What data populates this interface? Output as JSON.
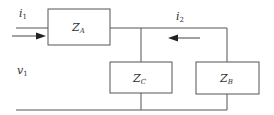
{
  "diagram": {
    "type": "two-port circuit",
    "labels": {
      "i1": "i",
      "i1_sub": "1",
      "i2": "i",
      "i2_sub": "2",
      "v1": "v",
      "v1_sub": "1",
      "za": "Z",
      "za_sub": "A",
      "zb": "Z",
      "zb_sub": "B",
      "zc": "Z",
      "zc_sub": "C"
    },
    "colors": {
      "line": "#555555",
      "text": "#333333"
    }
  }
}
